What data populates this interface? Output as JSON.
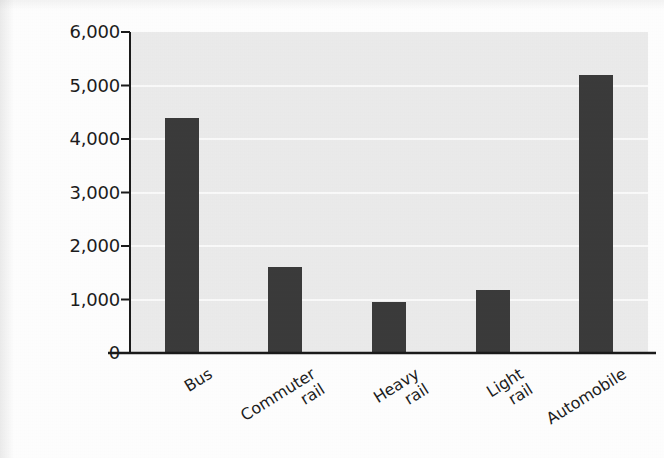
{
  "chart_data": {
    "type": "bar",
    "title": "",
    "subtitle": "",
    "xlabel": "",
    "ylabel": "BTU per passenger-mile",
    "categories": [
      "Bus",
      "Commuter rail",
      "Heavy rail",
      "Light rail",
      "Automobile"
    ],
    "category_lines": [
      [
        "Bus"
      ],
      [
        "Commuter",
        "rail"
      ],
      [
        "Heavy",
        "rail"
      ],
      [
        "Light",
        "rail"
      ],
      [
        "Automobile"
      ]
    ],
    "values": [
      4400,
      1600,
      950,
      1180,
      5200
    ],
    "ylim": [
      0,
      6000
    ],
    "ytick_values": [
      0,
      1000,
      2000,
      3000,
      4000,
      5000,
      6000
    ],
    "ytick_labels": [
      "0",
      "1,000",
      "2,000",
      "3,000",
      "4,000",
      "5,000",
      "6,000"
    ],
    "grid": "horizontal",
    "legend": "none",
    "bar_color": "#3b3b3b",
    "plot_background": "#ececec",
    "gridline_color": "#fbfbfb",
    "axis_color": "#1a1a1a",
    "x_label_rotation_deg": -32
  }
}
